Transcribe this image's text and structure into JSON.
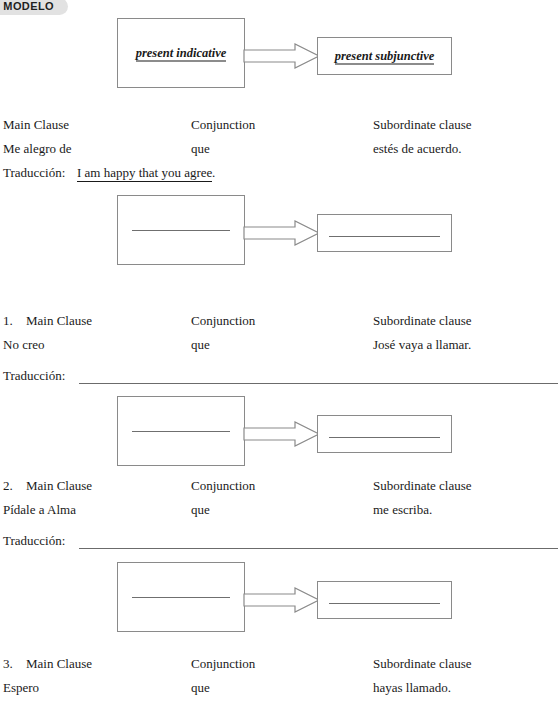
{
  "badge": {
    "label": "MODELO"
  },
  "model_diagram": {
    "left_box_label": "present indicative",
    "right_box_label": "present subjunctive",
    "arrow_icon": "block-arrow-right-icon"
  },
  "headers": {
    "main_clause": "Main Clause",
    "conjunction": "Conjunction",
    "subordinate_clause": "Subordinate clause"
  },
  "traduccion_label": "Traducción:",
  "example": {
    "main": "Me alegro de",
    "conjunction": "que",
    "subordinate": "estés de acuerdo.",
    "traduccion_answer": "I am happy that you agree",
    "traduccion_period": "."
  },
  "exercises": [
    {
      "number": "1.",
      "main": "No creo",
      "conjunction": "que",
      "subordinate": "José vaya a llamar.",
      "traduccion_answer": ""
    },
    {
      "number": "2.",
      "main": "Pídale a Alma",
      "conjunction": "que",
      "subordinate": "me escriba.",
      "traduccion_answer": ""
    },
    {
      "number": "3.",
      "main": "Espero",
      "conjunction": "que",
      "subordinate": "hayas llamado.",
      "traduccion_answer": ""
    }
  ],
  "colors": {
    "badge_bg": "#e2e2e2",
    "box_border": "#8a8a8a",
    "line": "#6b6b6b",
    "text": "#1a1a1a"
  }
}
